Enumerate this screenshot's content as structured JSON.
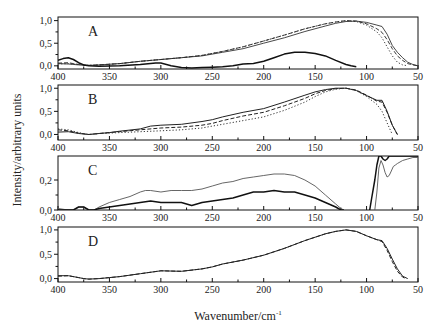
{
  "chart_data": {
    "type": "line",
    "ylabel": "Intensity/arbitrary units",
    "xlabel": "Wavenumber/cm",
    "xlabel_superscript": "-1",
    "x_reversed": true,
    "xlim": [
      400,
      50
    ],
    "x_ticks": [
      400,
      350,
      300,
      250,
      200,
      150,
      100,
      50
    ],
    "x_tick_labels": [
      "400",
      "350",
      "300",
      "250",
      "200",
      "150",
      "100",
      "50"
    ],
    "panels": [
      {
        "letter": "A",
        "ylim": [
          -0.07,
          1.08
        ],
        "y_ticks": [
          0.0,
          0.5,
          1.0
        ],
        "y_tick_labels": [
          "0,0",
          "0,5",
          "1,0"
        ],
        "series": [
          {
            "name": "A-solid-thin",
            "style": "solid",
            "width": 0.9,
            "color": "#333333",
            "x": [
              400,
              390,
              380,
              370,
              360,
              340,
              320,
              300,
              280,
              260,
              240,
              220,
              200,
              180,
              160,
              140,
              130,
              120,
              110,
              100,
              90,
              85,
              80,
              75,
              70,
              65,
              60,
              55,
              50
            ],
            "y": [
              0.05,
              0.04,
              0.02,
              0.01,
              0.02,
              0.05,
              0.1,
              0.14,
              0.18,
              0.22,
              0.3,
              0.38,
              0.5,
              0.62,
              0.76,
              0.88,
              0.94,
              0.98,
              0.99,
              0.96,
              0.9,
              0.87,
              0.7,
              0.45,
              0.3,
              0.18,
              0.08,
              0.03,
              0.0
            ]
          },
          {
            "name": "A-dashed",
            "style": "dashed",
            "width": 0.9,
            "color": "#222222",
            "x": [
              400,
              390,
              380,
              370,
              360,
              340,
              320,
              300,
              280,
              260,
              240,
              220,
              200,
              180,
              160,
              140,
              130,
              120,
              110,
              100,
              90,
              85,
              80,
              75,
              70,
              65,
              60,
              55,
              50
            ],
            "y": [
              0.06,
              0.07,
              0.03,
              0.01,
              0.02,
              0.05,
              0.1,
              0.14,
              0.18,
              0.23,
              0.32,
              0.42,
              0.55,
              0.68,
              0.82,
              0.93,
              0.97,
              1.0,
              0.99,
              0.93,
              0.82,
              0.74,
              0.58,
              0.38,
              0.22,
              0.12,
              0.05,
              0.02,
              0.0
            ]
          },
          {
            "name": "A-dotted",
            "style": "dotted",
            "width": 1.0,
            "color": "#333333",
            "x": [
              400,
              390,
              380,
              370,
              360,
              340,
              320,
              300,
              280,
              260,
              240,
              220,
              200,
              180,
              160,
              140,
              130,
              120,
              110,
              100,
              90,
              85,
              80,
              75,
              70,
              65,
              60
            ],
            "y": [
              0.04,
              0.05,
              0.03,
              0.01,
              0.02,
              0.05,
              0.1,
              0.14,
              0.18,
              0.23,
              0.32,
              0.42,
              0.55,
              0.68,
              0.82,
              0.93,
              0.97,
              1.0,
              0.98,
              0.9,
              0.75,
              0.62,
              0.42,
              0.22,
              0.08,
              0.02,
              0.0
            ]
          },
          {
            "name": "A-solid-thick",
            "style": "solid",
            "width": 1.5,
            "color": "#111111",
            "x": [
              400,
              395,
              390,
              385,
              380,
              375,
              370,
              360,
              340,
              320,
              305,
              300,
              290,
              280,
              270,
              260,
              250,
              240,
              230,
              220,
              210,
              200,
              190,
              180,
              170,
              160,
              150,
              140,
              130,
              120,
              115,
              110
            ],
            "y": [
              0.12,
              0.16,
              0.18,
              0.14,
              0.07,
              0.02,
              0.0,
              -0.01,
              0.0,
              0.03,
              0.06,
              0.06,
              0.0,
              -0.04,
              -0.05,
              -0.04,
              -0.03,
              -0.02,
              0.0,
              0.04,
              0.05,
              0.1,
              0.18,
              0.26,
              0.3,
              0.3,
              0.27,
              0.22,
              0.12,
              0.03,
              0.0,
              -0.02
            ]
          }
        ]
      },
      {
        "letter": "B",
        "ylim": [
          -0.12,
          1.07
        ],
        "y_ticks": [
          0.0,
          0.5,
          1.0
        ],
        "y_tick_labels": [
          "0,0",
          "0,5",
          "1,0"
        ],
        "series": [
          {
            "name": "B-solid",
            "style": "solid",
            "width": 1.0,
            "color": "#222222",
            "x": [
              400,
              390,
              380,
              370,
              360,
              350,
              340,
              320,
              310,
              300,
              280,
              260,
              250,
              240,
              220,
              200,
              180,
              160,
              150,
              140,
              130,
              120,
              110,
              100,
              90,
              85,
              80,
              75,
              70
            ],
            "y": [
              0.05,
              0.06,
              0.02,
              0.0,
              0.02,
              0.04,
              0.07,
              0.12,
              0.18,
              0.2,
              0.22,
              0.28,
              0.32,
              0.38,
              0.48,
              0.56,
              0.7,
              0.85,
              0.92,
              0.97,
              1.0,
              1.0,
              0.95,
              0.84,
              0.74,
              0.74,
              0.5,
              0.2,
              0.0
            ]
          },
          {
            "name": "B-dashed",
            "style": "dashed",
            "width": 1.0,
            "color": "#222222",
            "x": [
              400,
              390,
              380,
              370,
              360,
              350,
              340,
              320,
              300,
              280,
              260,
              250,
              240,
              220,
              200,
              180,
              160,
              150,
              140,
              130,
              120,
              110,
              100,
              90,
              85,
              80,
              75,
              70
            ],
            "y": [
              0.1,
              0.08,
              0.03,
              0.0,
              0.02,
              0.04,
              0.06,
              0.1,
              0.14,
              0.16,
              0.2,
              0.24,
              0.3,
              0.4,
              0.48,
              0.62,
              0.78,
              0.88,
              0.95,
              0.99,
              1.0,
              0.96,
              0.85,
              0.72,
              0.7,
              0.48,
              0.2,
              0.0
            ]
          },
          {
            "name": "B-dotted",
            "style": "dotted",
            "width": 1.0,
            "color": "#333333",
            "x": [
              400,
              390,
              380,
              370,
              360,
              350,
              340,
              320,
              300,
              280,
              260,
              250,
              240,
              220,
              200,
              180,
              160,
              150,
              140,
              130,
              120,
              110,
              100,
              90,
              85,
              80,
              75
            ],
            "y": [
              0.12,
              0.1,
              0.04,
              0.0,
              0.02,
              0.03,
              0.04,
              0.06,
              0.08,
              0.1,
              0.14,
              0.18,
              0.22,
              0.3,
              0.38,
              0.52,
              0.7,
              0.82,
              0.92,
              0.98,
              1.0,
              0.95,
              0.82,
              0.65,
              0.5,
              0.25,
              0.0
            ]
          }
        ]
      },
      {
        "letter": "C",
        "ylim": [
          0.0,
          0.36
        ],
        "y_ticks": [
          0.0,
          0.2
        ],
        "y_tick_labels": [
          "0,0",
          "0,2"
        ],
        "series": [
          {
            "name": "C-thin",
            "style": "solid",
            "width": 0.9,
            "color": "#555555",
            "x": [
              400,
              390,
              385,
              380,
              375,
              370,
              365,
              360,
              350,
              340,
              330,
              320,
              315,
              310,
              300,
              290,
              280,
              270,
              260,
              250,
              240,
              230,
              220,
              210,
              200,
              190,
              180,
              170,
              160,
              150,
              140,
              130,
              125,
              122
            ],
            "y": [
              0.01,
              0.0,
              0.0,
              0.02,
              0.02,
              0.0,
              0.0,
              0.02,
              0.05,
              0.07,
              0.09,
              0.12,
              0.13,
              0.13,
              0.12,
              0.13,
              0.13,
              0.13,
              0.14,
              0.16,
              0.18,
              0.19,
              0.21,
              0.22,
              0.23,
              0.24,
              0.24,
              0.23,
              0.2,
              0.16,
              0.1,
              0.04,
              0.01,
              0.0
            ]
          },
          {
            "name": "C-thick",
            "style": "solid",
            "width": 1.5,
            "color": "#111111",
            "x": [
              400,
              390,
              385,
              380,
              375,
              370,
              365,
              360,
              350,
              340,
              330,
              320,
              310,
              300,
              290,
              280,
              270,
              265,
              260,
              250,
              240,
              230,
              220,
              210,
              200,
              190,
              180,
              170,
              160,
              150,
              140,
              130,
              125,
              122
            ],
            "y": [
              0.0,
              0.0,
              0.0,
              0.02,
              0.02,
              0.0,
              0.0,
              0.01,
              0.02,
              0.03,
              0.04,
              0.05,
              0.06,
              0.05,
              0.05,
              0.05,
              0.03,
              0.04,
              0.05,
              0.06,
              0.07,
              0.08,
              0.1,
              0.12,
              0.12,
              0.13,
              0.12,
              0.12,
              0.1,
              0.08,
              0.05,
              0.02,
              0.0,
              0.0
            ]
          },
          {
            "name": "C-thick-right",
            "style": "solid",
            "width": 1.5,
            "color": "#111111",
            "x": [
              97,
              95,
              92,
              90,
              88,
              86,
              84,
              82,
              80,
              78,
              75,
              72,
              70,
              65,
              60,
              55,
              50
            ],
            "y": [
              0.0,
              0.08,
              0.2,
              0.3,
              0.36,
              0.36,
              0.34,
              0.33,
              0.34,
              0.36,
              0.36,
              0.36,
              0.36,
              0.36,
              0.36,
              0.36,
              0.36
            ]
          },
          {
            "name": "C-thin-right",
            "style": "solid",
            "width": 0.9,
            "color": "#555555",
            "x": [
              92,
              90,
              88,
              86,
              84,
              82,
              80,
              78,
              76,
              74,
              72,
              70,
              65,
              60,
              55,
              50
            ],
            "y": [
              0.0,
              0.12,
              0.28,
              0.33,
              0.3,
              0.25,
              0.22,
              0.23,
              0.26,
              0.29,
              0.3,
              0.31,
              0.33,
              0.34,
              0.35,
              0.35
            ]
          }
        ]
      },
      {
        "letter": "D",
        "ylim": [
          -0.07,
          1.06
        ],
        "y_ticks": [
          0.0,
          0.5,
          1.0
        ],
        "y_tick_labels": [
          "0,0",
          "0,5",
          "1,0"
        ],
        "series": [
          {
            "name": "D-solid",
            "style": "solid",
            "width": 1.0,
            "color": "#222222",
            "x": [
              400,
              390,
              380,
              375,
              370,
              360,
              350,
              340,
              320,
              300,
              280,
              260,
              250,
              240,
              220,
              200,
              180,
              160,
              140,
              130,
              120,
              110,
              100,
              90,
              85,
              80,
              75,
              70,
              65,
              60
            ],
            "y": [
              0.06,
              0.06,
              0.02,
              0.0,
              -0.01,
              0.0,
              0.02,
              0.04,
              0.1,
              0.16,
              0.15,
              0.2,
              0.24,
              0.3,
              0.38,
              0.48,
              0.62,
              0.78,
              0.92,
              0.97,
              1.0,
              0.97,
              0.88,
              0.8,
              0.78,
              0.62,
              0.4,
              0.2,
              0.05,
              0.0
            ]
          },
          {
            "name": "D-dashed",
            "style": "dashed",
            "width": 1.0,
            "color": "#222222",
            "x": [
              400,
              390,
              380,
              375,
              370,
              360,
              350,
              340,
              320,
              300,
              280,
              260,
              250,
              240,
              220,
              200,
              180,
              160,
              140,
              130,
              120,
              110,
              100,
              90,
              85,
              80,
              75,
              70,
              65,
              62
            ],
            "y": [
              0.05,
              0.06,
              0.02,
              0.0,
              -0.01,
              0.0,
              0.02,
              0.04,
              0.1,
              0.16,
              0.15,
              0.2,
              0.24,
              0.3,
              0.38,
              0.48,
              0.62,
              0.78,
              0.92,
              0.97,
              1.0,
              0.97,
              0.88,
              0.8,
              0.76,
              0.58,
              0.35,
              0.15,
              0.03,
              0.0
            ]
          }
        ]
      }
    ]
  }
}
